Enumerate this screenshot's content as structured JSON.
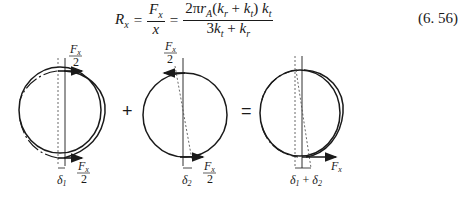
{
  "equation": {
    "lhs": "R",
    "lhs_sub": "x",
    "frac1_num": "F",
    "frac1_num_sub": "x",
    "frac1_den": "x",
    "frac2_num": "2πr",
    "frac2_num_sub": "A",
    "frac2_num_rest1": "(k",
    "frac2_num_rest1_sub": "r",
    "frac2_num_rest2": " + k",
    "frac2_num_rest2_sub": "t",
    "frac2_num_rest3": ") k",
    "frac2_num_rest3_sub": "t",
    "frac2_den_a": "3k",
    "frac2_den_a_sub": "t",
    "frac2_den_b": " + k",
    "frac2_den_b_sub": "r",
    "eq_sign": "=",
    "number": "(6. 56)"
  },
  "figure": {
    "operators": [
      "+",
      "="
    ],
    "labels": {
      "force_half": "F",
      "force_sub": "x",
      "half_den": "2",
      "delta1": "δ",
      "delta1_sub": "1",
      "delta2": "δ",
      "delta2_sub": "2",
      "delta_sum": "δ₁ + δ₂",
      "force_total": "F",
      "force_total_sub": "x"
    }
  }
}
